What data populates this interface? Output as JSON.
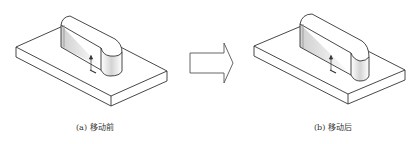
{
  "figure": {
    "left_panel": {
      "caption": "(a) 移动前",
      "label": "a",
      "state": "before-move"
    },
    "right_panel": {
      "caption": "(b) 移动后",
      "label": "b",
      "state": "after-move"
    },
    "arrow": {
      "direction": "right",
      "icon": "hollow-right-arrow"
    },
    "colors": {
      "line": "#333333",
      "shade": "#d0d0d0",
      "background": "#ffffff"
    }
  }
}
